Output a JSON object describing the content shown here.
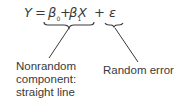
{
  "equation": {
    "lhs": "Y",
    "equals": "=",
    "beta0": "β",
    "beta0_sub": "0",
    "plus1": "+",
    "beta1": "β",
    "beta1_sub": "1",
    "x": "X",
    "plus2": "+",
    "epsilon": "ε"
  },
  "annotations": {
    "left": {
      "line1": "Nonrandom",
      "line2": "component:",
      "line3": "straight line"
    },
    "right": {
      "line1": "Random error"
    }
  },
  "colors": {
    "text": "#3a3a3a",
    "background": "#ffffff"
  }
}
